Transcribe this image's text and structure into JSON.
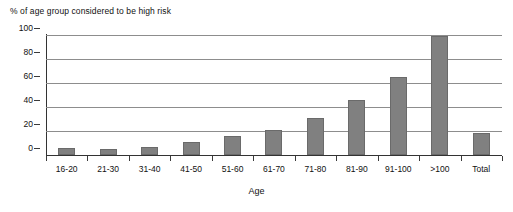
{
  "chart_data": {
    "type": "bar",
    "title": "% of age group considered to be high risk",
    "xlabel": "Age",
    "ylabel": "",
    "ylim": [
      0,
      100
    ],
    "yticks": [
      0,
      20,
      40,
      60,
      80,
      100
    ],
    "grid": true,
    "legend": false,
    "categories": [
      "16-20",
      "21-30",
      "31-40",
      "41-50",
      "51-60",
      "61-70",
      "71-80",
      "81-90",
      "91-100",
      ">100",
      "Total"
    ],
    "values": [
      6,
      5,
      7,
      11,
      16,
      21,
      31,
      46,
      65,
      99,
      18
    ],
    "series": [
      {
        "name": "% of age group considered to be high risk",
        "values": [
          6,
          5,
          7,
          11,
          16,
          21,
          31,
          46,
          65,
          99,
          18
        ]
      }
    ],
    "colors": {
      "bar_fill": "#808080",
      "bar_stroke": "#6a6a6a",
      "gridline": "#8d8d8d",
      "axis": "#333333",
      "text": "#111111",
      "background": "#ffffff"
    }
  }
}
